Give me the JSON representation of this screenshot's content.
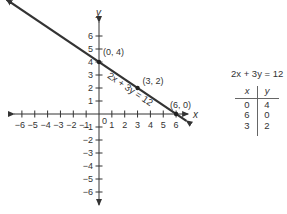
{
  "chart_data": {
    "type": "line",
    "title": "",
    "xlabel": "x",
    "ylabel": "y",
    "xlim": [
      -6,
      6
    ],
    "ylim": [
      -6,
      6
    ],
    "x_ticks": [
      -6,
      -5,
      -4,
      -3,
      -2,
      -1,
      1,
      2,
      3,
      4,
      5,
      6
    ],
    "y_ticks": [
      -6,
      -5,
      -4,
      -3,
      -2,
      -1,
      1,
      2,
      3,
      4,
      5,
      6
    ],
    "origin_label": "0",
    "grid": false,
    "series": [
      {
        "name": "2x + 3y = 12",
        "equation": "2x + 3y = 12",
        "line_extent_x": [
          -7.2,
          6.8
        ],
        "points": [
          {
            "x": 0,
            "y": 4,
            "label": "(0, 4)"
          },
          {
            "x": 3,
            "y": 2,
            "label": "(3, 2)"
          },
          {
            "x": 6,
            "y": 0,
            "label": "(6, 0)"
          }
        ]
      }
    ],
    "annotation": "2x + 3y = 12"
  },
  "table": {
    "title": "2x + 3y = 12",
    "headers": [
      "x",
      "y"
    ],
    "rows": [
      [
        "0",
        "4"
      ],
      [
        "6",
        "0"
      ],
      [
        "3",
        "2"
      ]
    ]
  }
}
